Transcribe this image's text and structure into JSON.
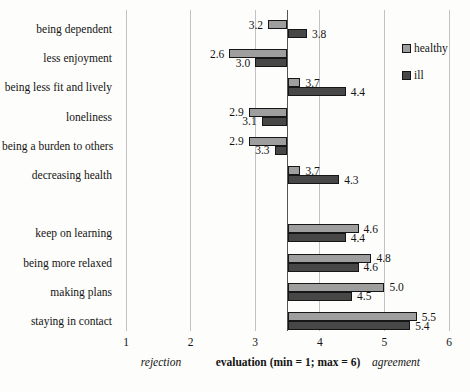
{
  "chart_data": {
    "type": "bar",
    "orientation": "horizontal",
    "categories": [
      "being dependent",
      "less enjoyment",
      "being less fit and lively",
      "loneliness",
      "being a burden to others",
      "decreasing health",
      "keep on learning",
      "being more relaxed",
      "making plans",
      "staying in contact"
    ],
    "series": [
      {
        "name": "healthy",
        "color": "#9e9e9e",
        "values": [
          3.2,
          2.6,
          3.7,
          2.9,
          2.9,
          3.7,
          4.6,
          4.8,
          5.0,
          5.5
        ]
      },
      {
        "name": "ill",
        "color": "#474747",
        "values": [
          3.8,
          3.0,
          4.4,
          3.1,
          3.3,
          4.3,
          4.4,
          4.6,
          4.5,
          5.4
        ]
      }
    ],
    "xlim": [
      1,
      6
    ],
    "x_ticks": [
      1,
      2,
      3,
      4,
      5,
      6
    ],
    "bar_base_value": 3.5,
    "group_gap_after_category_index": 5,
    "xlabel": "evaluation (min = 1; max = 6)",
    "x_axis_left_annotation": "rejection",
    "x_axis_right_annotation": "agreement",
    "value_label_decimals": 1,
    "grid": true,
    "legend_position": "right"
  },
  "colors": {
    "background": "#fdfdfb",
    "gridline": "#c2c2c2",
    "baseline_axis": "#555555",
    "bar_border": "#161616",
    "text": "#141414"
  }
}
